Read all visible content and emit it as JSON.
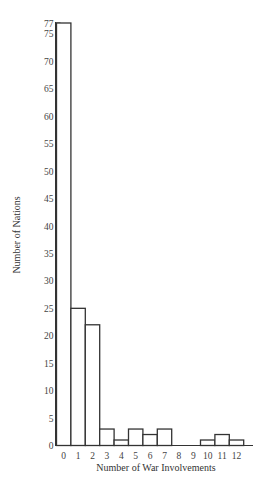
{
  "chart_data": {
    "type": "bar",
    "title": "",
    "xlabel": "Number of War Involvements",
    "ylabel": "Number of Nations",
    "categories": [
      "0",
      "1",
      "2",
      "3",
      "4",
      "5",
      "6",
      "7",
      "8",
      "9",
      "10",
      "11",
      "12"
    ],
    "values": [
      77,
      25,
      22,
      3,
      1,
      3,
      2,
      3,
      0,
      0,
      1,
      2,
      1
    ],
    "ylim": [
      0,
      77
    ],
    "yticks": [
      0,
      5,
      10,
      15,
      20,
      25,
      30,
      35,
      40,
      45,
      50,
      55,
      60,
      65,
      70,
      75,
      77
    ],
    "grid": false,
    "legend": null,
    "bar_style": {
      "fill": "#ffffff",
      "stroke": "#333333"
    }
  }
}
